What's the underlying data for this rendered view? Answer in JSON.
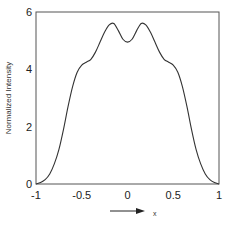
{
  "chart_data": {
    "type": "line",
    "title": "",
    "xlabel": "x",
    "ylabel": "Normalized Intensity",
    "xlim": [
      -1,
      1
    ],
    "ylim": [
      0,
      6
    ],
    "x_ticks": [
      "-1",
      "-0.5",
      "0",
      "0.5",
      "1"
    ],
    "y_ticks": [
      "0",
      "2",
      "4",
      "6"
    ],
    "grid": false,
    "legend": null,
    "annotations": [
      "arrow pointing right above x label"
    ],
    "series": [
      {
        "name": "intensity",
        "x": [
          -1.0,
          -0.95,
          -0.9,
          -0.85,
          -0.8,
          -0.75,
          -0.7,
          -0.65,
          -0.6,
          -0.55,
          -0.5,
          -0.45,
          -0.4,
          -0.35,
          -0.3,
          -0.25,
          -0.2,
          -0.15,
          -0.1,
          -0.05,
          0.0,
          0.05,
          0.1,
          0.15,
          0.2,
          0.25,
          0.3,
          0.35,
          0.4,
          0.45,
          0.5,
          0.55,
          0.6,
          0.65,
          0.7,
          0.75,
          0.8,
          0.85,
          0.9,
          0.95,
          1.0
        ],
        "y": [
          0.0,
          0.05,
          0.15,
          0.35,
          0.7,
          1.2,
          1.9,
          2.7,
          3.4,
          3.9,
          4.15,
          4.25,
          4.35,
          4.6,
          4.95,
          5.3,
          5.55,
          5.6,
          5.35,
          5.05,
          4.95,
          5.05,
          5.35,
          5.6,
          5.55,
          5.3,
          4.95,
          4.6,
          4.35,
          4.25,
          4.15,
          3.9,
          3.4,
          2.7,
          1.9,
          1.2,
          0.7,
          0.35,
          0.15,
          0.05,
          0.0
        ]
      }
    ]
  },
  "plot": {
    "left": 36,
    "right": 219,
    "top": 12,
    "bottom": 184,
    "line_color": "#333333",
    "axis_color": "#555555"
  }
}
